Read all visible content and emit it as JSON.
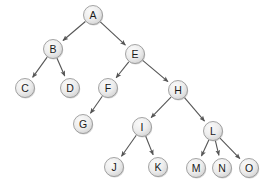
{
  "figure": {
    "name": "tree-diagram",
    "width": 275,
    "height": 189,
    "background": "#ffffff"
  },
  "style": {
    "node_fill_light": "#f4f4f4",
    "node_fill_mid": "#e2e2e2",
    "node_fill_dark": "#cfcfcf",
    "node_stroke": "#8e8e8e",
    "edge_color": "#555555",
    "label_color": "#1a1a1a",
    "node_radius": 9.5
  },
  "nodes": [
    {
      "id": "A",
      "label": "A",
      "x": 93,
      "y": 15,
      "depth": 0
    },
    {
      "id": "B",
      "label": "B",
      "x": 53,
      "y": 49,
      "depth": 1
    },
    {
      "id": "E",
      "label": "E",
      "x": 135,
      "y": 54,
      "depth": 1
    },
    {
      "id": "C",
      "label": "C",
      "x": 25,
      "y": 88,
      "depth": 2
    },
    {
      "id": "D",
      "label": "D",
      "x": 70,
      "y": 88,
      "depth": 2
    },
    {
      "id": "F",
      "label": "F",
      "x": 108,
      "y": 88,
      "depth": 2
    },
    {
      "id": "H",
      "label": "H",
      "x": 178,
      "y": 90,
      "depth": 2
    },
    {
      "id": "G",
      "label": "G",
      "x": 83,
      "y": 124,
      "depth": 3
    },
    {
      "id": "I",
      "label": "I",
      "x": 142,
      "y": 127,
      "depth": 3
    },
    {
      "id": "L",
      "label": "L",
      "x": 213,
      "y": 131,
      "depth": 3
    },
    {
      "id": "J",
      "label": "J",
      "x": 114,
      "y": 167,
      "depth": 4
    },
    {
      "id": "K",
      "label": "K",
      "x": 158,
      "y": 167,
      "depth": 4
    },
    {
      "id": "M",
      "label": "M",
      "x": 196,
      "y": 168,
      "depth": 4
    },
    {
      "id": "N",
      "label": "N",
      "x": 222,
      "y": 168,
      "depth": 4
    },
    {
      "id": "O",
      "label": "O",
      "x": 249,
      "y": 168,
      "depth": 4
    }
  ],
  "edges": [
    {
      "from": "A",
      "to": "B"
    },
    {
      "from": "A",
      "to": "E"
    },
    {
      "from": "B",
      "to": "C"
    },
    {
      "from": "B",
      "to": "D"
    },
    {
      "from": "E",
      "to": "F"
    },
    {
      "from": "E",
      "to": "H"
    },
    {
      "from": "F",
      "to": "G"
    },
    {
      "from": "H",
      "to": "I"
    },
    {
      "from": "H",
      "to": "L"
    },
    {
      "from": "I",
      "to": "J"
    },
    {
      "from": "I",
      "to": "K"
    },
    {
      "from": "L",
      "to": "M"
    },
    {
      "from": "L",
      "to": "N"
    },
    {
      "from": "L",
      "to": "O"
    }
  ]
}
